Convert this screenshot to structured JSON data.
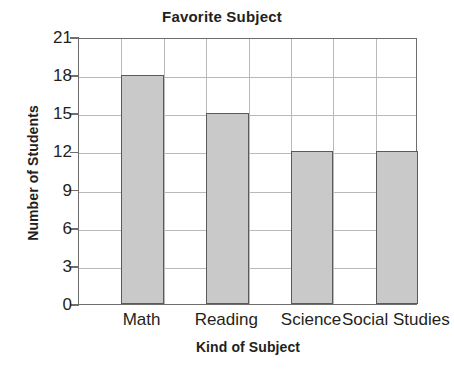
{
  "chart_data": {
    "type": "bar",
    "title": "Favorite Subject",
    "xlabel": "Kind of Subject",
    "ylabel": "Number of Students",
    "categories": [
      "Math",
      "Reading",
      "Science",
      "Social Studies"
    ],
    "values": [
      18,
      15,
      12,
      12
    ],
    "ylim": [
      0,
      21
    ],
    "ytick_values": [
      0,
      3,
      6,
      9,
      12,
      15,
      18,
      21
    ],
    "ytick_labels": [
      "0",
      "3",
      "6",
      "9",
      "12",
      "15",
      "18",
      "21"
    ],
    "grid": "both",
    "legend": "none",
    "bar_fill_color": "#c9c9c9",
    "bar_border_color": "#5a5a5a",
    "gridline_color": "#b9b9b9",
    "axis_color": "#6e6e6e",
    "text_color": "#231f20",
    "background_color": "#ffffff"
  }
}
